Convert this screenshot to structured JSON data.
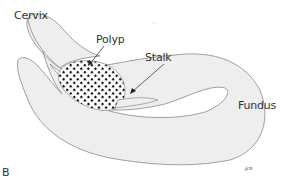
{
  "figure": {
    "panel_letter": "B",
    "signature": "jcn",
    "labels": {
      "cervix": "Cervix",
      "polyp": "Polyp",
      "stalk": "Stalk",
      "fundus": "Fundus"
    },
    "colors": {
      "outline": "#7a7a7a",
      "fill": "#eeeeee",
      "polyp_pattern": "#111111",
      "text": "#333333"
    }
  }
}
